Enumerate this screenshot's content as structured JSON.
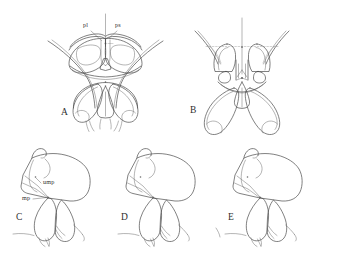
{
  "figure": {
    "background_color": "#ffffff",
    "line_color": "#4a4a4a",
    "faint_line_color": "#9a9a9a",
    "width": 337,
    "height": 263,
    "panel_count": 5,
    "row_layout": [
      2,
      3
    ]
  },
  "panels": [
    {
      "id": "A",
      "label": "A",
      "view": "dorsal",
      "label_x": 61,
      "label_y": 115,
      "part_labels": [
        {
          "key": "pl",
          "text": "pl",
          "x": 83,
          "y": 27
        },
        {
          "key": "ps",
          "text": "ps",
          "x": 115,
          "y": 27
        }
      ]
    },
    {
      "id": "B",
      "label": "B",
      "view": "dorsal",
      "label_x": 190,
      "label_y": 113,
      "part_labels": []
    },
    {
      "id": "C",
      "label": "C",
      "view": "lateral",
      "label_x": 16,
      "label_y": 220,
      "part_labels": [
        {
          "key": "ump",
          "text": "ump",
          "x": 43,
          "y": 184
        },
        {
          "key": "mp",
          "text": "mp",
          "x": 22,
          "y": 200
        }
      ]
    },
    {
      "id": "D",
      "label": "D",
      "view": "lateral",
      "label_x": 121,
      "label_y": 220,
      "part_labels": []
    },
    {
      "id": "E",
      "label": "E",
      "view": "lateral",
      "label_x": 228,
      "label_y": 220,
      "part_labels": []
    }
  ],
  "abbreviations": [
    {
      "key": "pl",
      "text": "pl"
    },
    {
      "key": "ps",
      "text": "ps"
    },
    {
      "key": "ump",
      "text": "ump"
    },
    {
      "key": "mp",
      "text": "mp"
    }
  ]
}
